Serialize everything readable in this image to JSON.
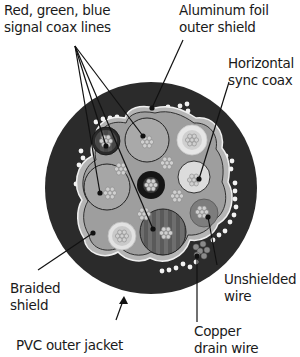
{
  "labels": {
    "rgb_coax": [
      "Red, green, blue",
      "signal coax lines"
    ],
    "foil_shield": [
      "Aluminum foil",
      "outer shield"
    ],
    "hsync_coax": [
      "Horizontal",
      "sync coax"
    ],
    "braided_shield": [
      "Braided",
      "shield"
    ],
    "unshielded_wire": [
      "Unshielded",
      "wire"
    ],
    "drain_wire": [
      "Copper",
      "drain wire"
    ],
    "pvc_jacket": [
      "PVC outer jacket"
    ]
  },
  "colors": {
    "jacket": "#2b2b2b",
    "foil": "#b3b3b3",
    "inner_fill": "#9a9a9a",
    "coax_gray": "#a8a8a8",
    "coax_light": "#d8d8d8",
    "coax_dark": "#1c1c1c",
    "braid_dot": "#f5f5f5",
    "line": "#111111"
  }
}
